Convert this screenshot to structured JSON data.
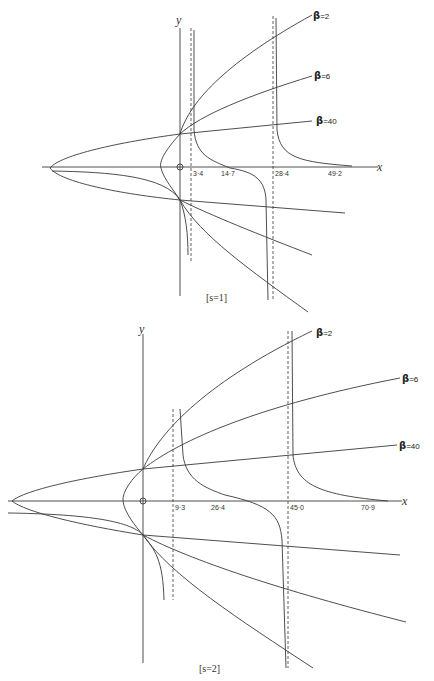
{
  "diagrams": [
    {
      "id": "s1",
      "caption": "[s=1]",
      "x_axis_label": "x",
      "y_axis_label": "y",
      "origin_label": "O",
      "tick_labels": [
        "3·4",
        "14·7",
        "28·4",
        "49·2"
      ],
      "asymptote_values": [
        "3·4",
        "28·4"
      ],
      "beta_labels": [
        {
          "symbol": "β",
          "value": "=2"
        },
        {
          "symbol": "β",
          "value": "=6"
        },
        {
          "symbol": "β",
          "value": "=40"
        }
      ]
    },
    {
      "id": "s2",
      "caption": "[s=2]",
      "x_axis_label": "x",
      "y_axis_label": "y",
      "origin_label": "O",
      "tick_labels": [
        "9·3",
        "26·4",
        "45·0",
        "70·9"
      ],
      "asymptote_values": [
        "9·3",
        "45·0"
      ],
      "beta_labels": [
        {
          "symbol": "β",
          "value": "=2"
        },
        {
          "symbol": "β",
          "value": "=6"
        },
        {
          "symbol": "β",
          "value": "=40"
        }
      ]
    }
  ]
}
